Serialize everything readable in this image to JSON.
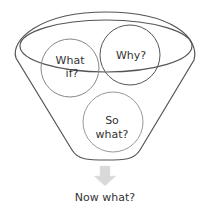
{
  "diagram": {
    "type": "funnel",
    "circles": [
      {
        "id": "what-if",
        "line1": "What",
        "line2": "if?"
      },
      {
        "id": "why",
        "line1": "Why?"
      },
      {
        "id": "so-what",
        "line1": "So",
        "line2": "what?"
      }
    ],
    "output_label": "Now what?",
    "colors": {
      "funnel_stroke": "#555555",
      "circle_stroke": "#888888",
      "arrow_fill": "#d9d9d9",
      "text": "#333333"
    }
  }
}
